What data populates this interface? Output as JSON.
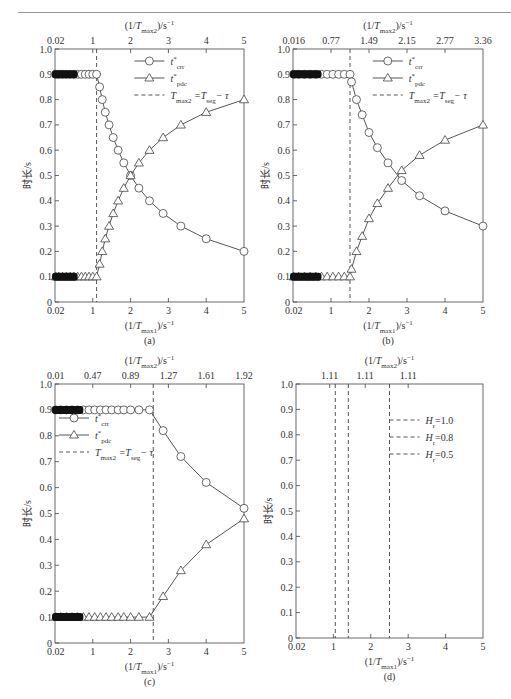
{
  "chart_data": [
    {
      "panel": "(a)",
      "type": "line",
      "ylabel": "时长/s",
      "xlabel_bottom": "(1/Tmax1)/s⁻¹",
      "xlabel_top": "(1/Tmax2)/s⁻¹",
      "ylim": [
        0,
        1.0
      ],
      "xlim": [
        0.02,
        5
      ],
      "y_ticks": [
        "0",
        "0.1",
        "0.2",
        "0.3",
        "0.4",
        "0.5",
        "0.6",
        "0.7",
        "0.8",
        "0.9",
        "1.0"
      ],
      "x_ticks_bottom": [
        "0.02",
        "1",
        "2",
        "3",
        "4",
        "5"
      ],
      "x_ticks_top": [
        "0.02",
        "1",
        "2",
        "3",
        "4",
        "5"
      ],
      "vline_x": 1.1,
      "legend": [
        "t*crr",
        "t*pdc",
        "Tmax2 = Tseg − τ"
      ],
      "legend_position": "upper right",
      "series": [
        {
          "name": "t*crr",
          "marker": "circle",
          "x": [
            0.02,
            0.1,
            0.2,
            0.3,
            0.4,
            0.5,
            0.6,
            0.7,
            0.8,
            0.9,
            1.0,
            1.1,
            1.18,
            1.25,
            1.33,
            1.43,
            1.54,
            1.67,
            1.82,
            2.0,
            2.22,
            2.5,
            2.86,
            3.33,
            4.0,
            5.0
          ],
          "values": [
            0.9,
            0.9,
            0.9,
            0.9,
            0.9,
            0.9,
            0.9,
            0.9,
            0.9,
            0.9,
            0.9,
            0.9,
            0.85,
            0.8,
            0.75,
            0.7,
            0.65,
            0.6,
            0.55,
            0.5,
            0.45,
            0.4,
            0.35,
            0.3,
            0.25,
            0.2
          ]
        },
        {
          "name": "t*pdc",
          "marker": "triangle",
          "x": [
            0.02,
            0.1,
            0.2,
            0.3,
            0.4,
            0.5,
            0.6,
            0.7,
            0.8,
            0.9,
            1.0,
            1.1,
            1.18,
            1.25,
            1.33,
            1.43,
            1.54,
            1.67,
            1.82,
            2.0,
            2.22,
            2.5,
            2.86,
            3.33,
            4.0,
            5.0
          ],
          "values": [
            0.1,
            0.1,
            0.1,
            0.1,
            0.1,
            0.1,
            0.1,
            0.1,
            0.1,
            0.1,
            0.1,
            0.1,
            0.15,
            0.2,
            0.25,
            0.3,
            0.35,
            0.4,
            0.45,
            0.5,
            0.55,
            0.6,
            0.65,
            0.7,
            0.75,
            0.8
          ]
        }
      ]
    },
    {
      "panel": "(b)",
      "type": "line",
      "ylabel": "时长/s",
      "xlabel_bottom": "(1/Tmax1)/s⁻¹",
      "xlabel_top": "(1/Tmax2)/s⁻¹",
      "ylim": [
        0,
        1.0
      ],
      "xlim": [
        0.02,
        5
      ],
      "y_ticks": [
        "0",
        "0.1",
        "0.2",
        "0.3",
        "0.4",
        "0.5",
        "0.6",
        "0.7",
        "0.8",
        "0.9",
        "1.0"
      ],
      "x_ticks_bottom": [
        "0.02",
        "1",
        "2",
        "3",
        "4",
        "5"
      ],
      "x_ticks_top": [
        "0.016",
        "0.77",
        "1.49",
        "2.15",
        "2.77",
        "3.36"
      ],
      "vline_x": 1.5,
      "legend": [
        "t*crr",
        "t*pdc",
        "Tmax2 = Tseg − τ"
      ],
      "legend_position": "upper right",
      "series": [
        {
          "name": "t*crr",
          "marker": "circle",
          "x": [
            0.02,
            0.15,
            0.3,
            0.45,
            0.6,
            0.75,
            0.9,
            1.05,
            1.2,
            1.35,
            1.5,
            1.54,
            1.67,
            1.82,
            2.0,
            2.22,
            2.5,
            2.86,
            3.33,
            4.0,
            5.0
          ],
          "values": [
            0.9,
            0.9,
            0.9,
            0.9,
            0.9,
            0.9,
            0.9,
            0.9,
            0.9,
            0.9,
            0.9,
            0.87,
            0.8,
            0.74,
            0.67,
            0.61,
            0.55,
            0.48,
            0.42,
            0.36,
            0.3
          ]
        },
        {
          "name": "t*pdc",
          "marker": "triangle",
          "x": [
            0.02,
            0.15,
            0.3,
            0.45,
            0.6,
            0.75,
            0.9,
            1.05,
            1.2,
            1.35,
            1.5,
            1.54,
            1.67,
            1.82,
            2.0,
            2.22,
            2.5,
            2.86,
            3.33,
            4.0,
            5.0
          ],
          "values": [
            0.1,
            0.1,
            0.1,
            0.1,
            0.1,
            0.1,
            0.1,
            0.1,
            0.1,
            0.1,
            0.1,
            0.13,
            0.2,
            0.26,
            0.33,
            0.39,
            0.45,
            0.52,
            0.58,
            0.64,
            0.7
          ]
        }
      ]
    },
    {
      "panel": "(c)",
      "type": "line",
      "ylabel": "时长/s",
      "xlabel_bottom": "(1/Tmax1)/s⁻¹",
      "xlabel_top": "(1/Tmax2)/s⁻¹",
      "ylim": [
        0,
        1.0
      ],
      "xlim": [
        0.02,
        5
      ],
      "y_ticks": [
        "0",
        "0.1",
        "0.2",
        "0.3",
        "0.4",
        "0.5",
        "0.6",
        "0.7",
        "0.8",
        "0.9",
        "1.0"
      ],
      "x_ticks_bottom": [
        "0.02",
        "1",
        "2",
        "3",
        "4",
        "5"
      ],
      "x_ticks_top": [
        "0.01",
        "0.47",
        "0.89",
        "1.27",
        "1.61",
        "1.92"
      ],
      "vline_x": 2.6,
      "legend": [
        "t*crr",
        "t*pdc",
        "Tmax2 = Tseg − τ"
      ],
      "legend_position": "upper left",
      "series": [
        {
          "name": "t*crr",
          "marker": "circle",
          "x": [
            0.02,
            0.15,
            0.3,
            0.45,
            0.6,
            0.75,
            0.9,
            1.05,
            1.2,
            1.35,
            1.5,
            1.67,
            1.82,
            2.0,
            2.22,
            2.5,
            2.86,
            3.33,
            4.0,
            5.0
          ],
          "values": [
            0.9,
            0.9,
            0.9,
            0.9,
            0.9,
            0.9,
            0.9,
            0.9,
            0.9,
            0.9,
            0.9,
            0.9,
            0.9,
            0.9,
            0.9,
            0.9,
            0.82,
            0.72,
            0.62,
            0.52
          ]
        },
        {
          "name": "t*pdc",
          "marker": "triangle",
          "x": [
            0.02,
            0.15,
            0.3,
            0.45,
            0.6,
            0.75,
            0.9,
            1.05,
            1.2,
            1.35,
            1.5,
            1.67,
            1.82,
            2.0,
            2.22,
            2.5,
            2.86,
            3.33,
            4.0,
            5.0
          ],
          "values": [
            0.1,
            0.1,
            0.1,
            0.1,
            0.1,
            0.1,
            0.1,
            0.1,
            0.1,
            0.1,
            0.1,
            0.1,
            0.1,
            0.1,
            0.1,
            0.1,
            0.18,
            0.28,
            0.38,
            0.48
          ]
        }
      ]
    },
    {
      "panel": "(d)",
      "type": "line",
      "ylabel": "时长/s",
      "xlabel_bottom": "(1/Tmax1)/s⁻¹",
      "xlabel_top": "(1/Tmax2)/s⁻¹",
      "ylim": [
        0,
        1.0
      ],
      "xlim": [
        0.02,
        5
      ],
      "y_ticks": [
        "0",
        "0.1",
        "0.2",
        "0.3",
        "0.4",
        "0.5",
        "0.6",
        "0.7",
        "0.8",
        "0.9",
        "1.0"
      ],
      "x_ticks_bottom": [
        "0.02",
        "1",
        "2",
        "3",
        "4",
        "5"
      ],
      "x_ticks_top": [
        "1.11",
        "1.11",
        "1.11"
      ],
      "vlines": [
        {
          "name": "Hr=1.0",
          "x": 1.05
        },
        {
          "name": "Hr=0.8",
          "x": 1.4
        },
        {
          "name": "Hr=0.5",
          "x": 2.5
        }
      ],
      "legend": [
        "Hr=1.0",
        "Hr=0.8",
        "Hr=0.5"
      ],
      "legend_position": "upper right"
    }
  ],
  "labels": {
    "ylabel": "时长/s",
    "xlabel_bottom_main": "(1/T",
    "xlabel_bottom_sub": "max1",
    "xlabel_top_sub": "max2",
    "xlabel_tail": ")/s",
    "xlabel_sup": "−1",
    "panel_a": "(a)",
    "panel_b": "(b)",
    "panel_c": "(c)",
    "panel_d": "(d)",
    "legend_crr_main": "t",
    "legend_crr_sub": "crr",
    "legend_pdc_sub": "pdc",
    "legend_star": "*",
    "legend_vline": "T",
    "legend_vline_sub1": "max2",
    "legend_vline_mid": " =T",
    "legend_vline_sub2": "seg",
    "legend_vline_tail": "− τ",
    "legend_hr_main": "H",
    "legend_hr_sub": "r",
    "legend_hr_vals": [
      "=1.0",
      "=0.8",
      "=0.5"
    ]
  }
}
